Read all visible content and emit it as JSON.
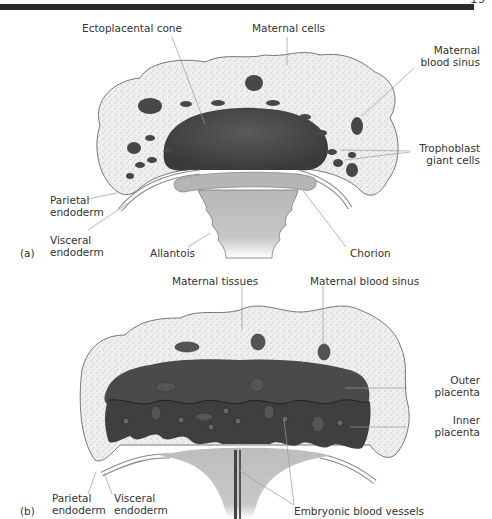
{
  "page": {
    "page_number_partial": "19"
  },
  "panel_a": {
    "tag": "(a)",
    "labels": {
      "ectoplacental_cone": "Ectoplacental cone",
      "maternal_cells": "Maternal cells",
      "maternal_blood_sinus": "Maternal\nblood sinus",
      "trophoblast_giant_cells": "Trophoblast\ngiant cells",
      "parietal_endoderm": "Parietal\nendoderm",
      "visceral_endoderm": "Visceral\nendoderm",
      "allantois": "Allantois",
      "chorion": "Chorion"
    }
  },
  "panel_b": {
    "tag": "(b)",
    "labels": {
      "maternal_tissues": "Maternal tissues",
      "maternal_blood_sinus": "Maternal blood sinus",
      "outer_placenta": "Outer\nplacenta",
      "inner_placenta": "Inner\nplacenta",
      "parietal_endoderm": "Parietal\nendoderm",
      "visceral_endoderm": "Visceral\nendoderm",
      "embryonic_blood_vessels": "Embryonic blood vessels"
    }
  },
  "colors": {
    "maternal_tissue": "#ececec",
    "dark_placenta": "#4a4a4a",
    "allantois": "#bdbdbd",
    "outline": "#777777",
    "leader_line": "#999999"
  }
}
